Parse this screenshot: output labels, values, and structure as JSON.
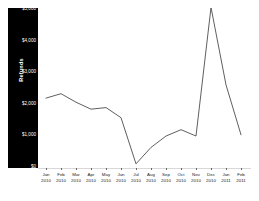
{
  "chart_data": {
    "type": "line",
    "title": "",
    "xlabel": "",
    "ylabel": "Refunds",
    "ylim": [
      0,
      5000
    ],
    "yticks": [
      0,
      1000,
      2000,
      3000,
      4000,
      5000
    ],
    "ytick_labels": [
      "$0",
      "$1,000",
      "$2,000",
      "$3,000",
      "$4,000",
      "$5,000"
    ],
    "grid": false,
    "legend": "none",
    "line_color": "#4d4d4d",
    "panel_color": "#000000",
    "categories": [
      "Jan 2010",
      "Feb 2010",
      "Mar 2010",
      "Apr 2010",
      "May 2010",
      "Jun 2010",
      "Jul 2010",
      "Aug 2010",
      "Sep 2010",
      "Oct 2010",
      "Nov 2010",
      "Dec 2010",
      "Jan 2011",
      "Feb 2011"
    ],
    "categories_month": [
      "Jan",
      "Feb",
      "Mar",
      "Apr",
      "May",
      "Jun",
      "Jul",
      "Aug",
      "Sep",
      "Oct",
      "Nov",
      "Dec",
      "Jan",
      "Feb"
    ],
    "categories_year": [
      "2010",
      "2010",
      "2010",
      "2010",
      "2010",
      "2010",
      "2010",
      "2010",
      "2010",
      "2010",
      "2010",
      "2010",
      "2011",
      "2011"
    ],
    "series": [
      {
        "name": "Refunds",
        "values": [
          2180,
          2320,
          2050,
          1830,
          1880,
          1560,
          100,
          620,
          980,
          1180,
          980,
          5050,
          2600,
          1020
        ]
      }
    ]
  }
}
